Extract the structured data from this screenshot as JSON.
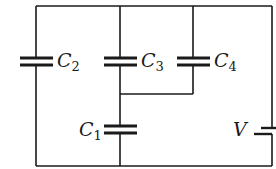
{
  "diagram": {
    "type": "circuit",
    "components": [
      {
        "id": "C1",
        "kind": "capacitor",
        "label": "C",
        "sub": "1"
      },
      {
        "id": "C2",
        "kind": "capacitor",
        "label": "C",
        "sub": "2"
      },
      {
        "id": "C3",
        "kind": "capacitor",
        "label": "C",
        "sub": "3"
      },
      {
        "id": "C4",
        "kind": "capacitor",
        "label": "C",
        "sub": "4"
      },
      {
        "id": "V",
        "kind": "battery",
        "label": "V"
      }
    ],
    "topology": "C3 parallel C4, that combination in series with C1; C2 in parallel with the series branch; all across battery V"
  },
  "labels": {
    "c1": {
      "main": "C",
      "sub": "1"
    },
    "c2": {
      "main": "C",
      "sub": "2"
    },
    "c3": {
      "main": "C",
      "sub": "3"
    },
    "c4": {
      "main": "C",
      "sub": "4"
    },
    "v": {
      "main": "V"
    }
  }
}
